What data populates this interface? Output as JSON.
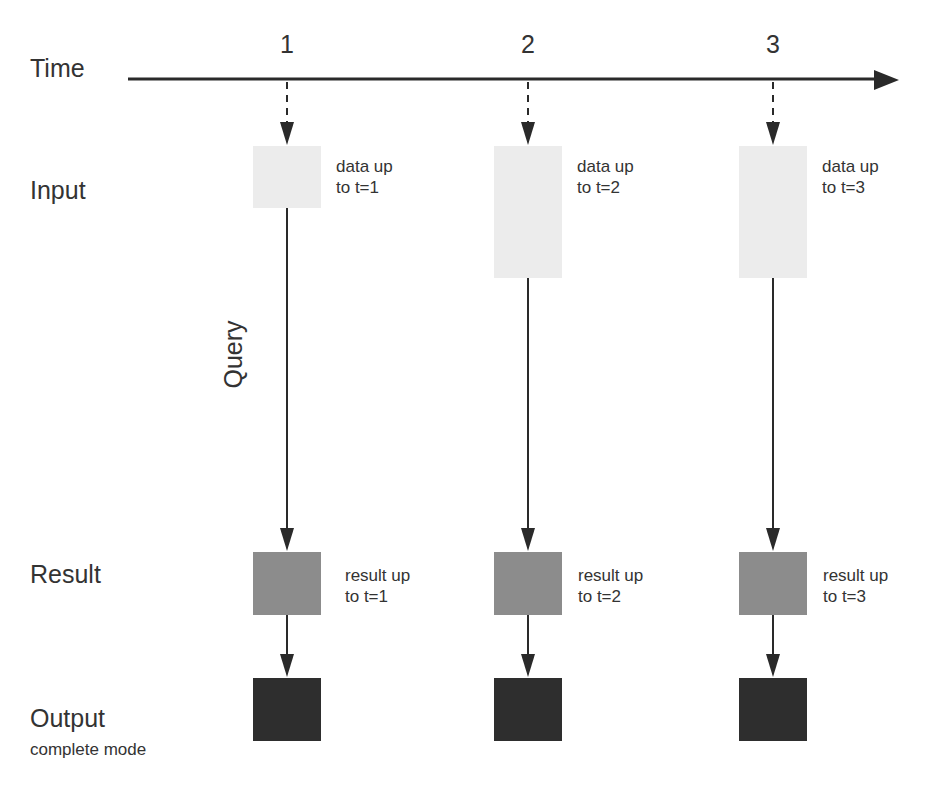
{
  "rows": {
    "time": "Time",
    "input": "Input",
    "result": "Result",
    "output": "Output",
    "output_mode": "complete mode"
  },
  "query_label": "Query",
  "ticks": [
    "1",
    "2",
    "3"
  ],
  "columns": [
    {
      "tick": "1",
      "input_note_1": "data up",
      "input_note_2": "to t=1",
      "result_note_1": "result up",
      "result_note_2": "to t=1"
    },
    {
      "tick": "2",
      "input_note_1": "data up",
      "input_note_2": "to t=2",
      "result_note_1": "result up",
      "result_note_2": "to t=2"
    },
    {
      "tick": "3",
      "input_note_1": "data up",
      "input_note_2": "to t=3",
      "result_note_1": "result up",
      "result_note_2": "to t=3"
    }
  ],
  "colors": {
    "input_box": "#ececec",
    "result_box": "#8c8c8c",
    "output_box": "#2e2e2e",
    "line": "#2a2a2a"
  }
}
